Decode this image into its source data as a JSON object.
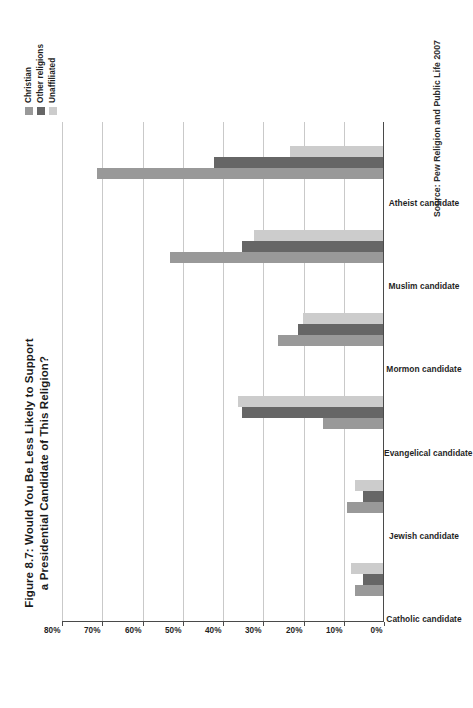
{
  "figure": {
    "title_line1": "Figure 8.7: Would You Be Less Likely to Support",
    "title_line2": "a Presidential Candidate of This Religion?",
    "source": "Source: Pew Religion and Public Life 2007"
  },
  "legend": {
    "entries": [
      {
        "label": "Christian",
        "color": "#999999"
      },
      {
        "label": "Other religions",
        "color": "#666666"
      },
      {
        "label": "Unaffiliated",
        "color": "#cccccc"
      }
    ]
  },
  "axis": {
    "tick_labels": [
      "0%",
      "10%",
      "20%",
      "30%",
      "40%",
      "50%",
      "60%",
      "70%",
      "80%"
    ]
  },
  "chart_data": {
    "type": "bar",
    "orientation": "vertical-printed-sideways",
    "title": "Figure 8.7: Would You Be Less Likely to Support a Presidential Candidate of This Religion?",
    "xlabel": "",
    "ylabel": "",
    "ylim": [
      0,
      80
    ],
    "ytick_labels": [
      "0%",
      "10%",
      "20%",
      "30%",
      "40%",
      "50%",
      "60%",
      "70%",
      "80%"
    ],
    "yticks": [
      0,
      10,
      20,
      30,
      40,
      50,
      60,
      70,
      80
    ],
    "grid": true,
    "legend_position": "top-right",
    "categories": [
      "Catholic candidate",
      "Jewish candidate",
      "Evangelical candidate",
      "Mormon candidate",
      "Muslim candidate",
      "Atheist candidate"
    ],
    "series": [
      {
        "name": "Christian",
        "color": "#999999",
        "values": [
          7,
          9,
          15,
          26,
          53,
          71
        ]
      },
      {
        "name": "Other religions",
        "color": "#666666",
        "values": [
          5,
          5,
          35,
          21,
          35,
          42
        ]
      },
      {
        "name": "Unaffiliated",
        "color": "#cccccc",
        "values": [
          8,
          7,
          36,
          20,
          32,
          23
        ]
      }
    ],
    "source": "Source: Pew Religion and Public Life 2007"
  }
}
